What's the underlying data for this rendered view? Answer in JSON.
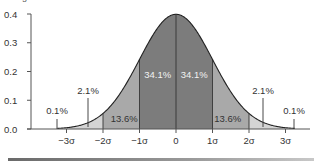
{
  "caption_fragment": "...ming Research",
  "chart_data": {
    "type": "area",
    "xlabel": "",
    "ylabel": "",
    "ylim": [
      0.0,
      0.4
    ],
    "xlim": [
      -3.5,
      3.5
    ],
    "y_ticks": [
      "0.0",
      "0.1",
      "0.2",
      "0.3",
      "0.4"
    ],
    "y_tick_values": [
      0.0,
      0.1,
      0.2,
      0.3,
      0.4
    ],
    "x_ticks": [
      "−3σ",
      "−2σ",
      "−1σ",
      "0",
      "1σ",
      "2σ",
      "3σ"
    ],
    "x_tick_values": [
      -3,
      -2,
      -1,
      0,
      1,
      2,
      3
    ],
    "grid": false,
    "curve": "normal pdf, mean 0, sd 1 (peak ≈ 0.399)",
    "regions": [
      {
        "from": -3,
        "to": -2,
        "percent": "2.1%",
        "color": "#d4d4d4"
      },
      {
        "from": -2,
        "to": -1,
        "percent": "13.6%",
        "color": "#a9a9a9"
      },
      {
        "from": -1,
        "to": 0,
        "percent": "34.1%",
        "color": "#7c7c7c"
      },
      {
        "from": 0,
        "to": 1,
        "percent": "34.1%",
        "color": "#7c7c7c"
      },
      {
        "from": 1,
        "to": 2,
        "percent": "13.6%",
        "color": "#a9a9a9"
      },
      {
        "from": 2,
        "to": 3,
        "percent": "2.1%",
        "color": "#d4d4d4"
      }
    ],
    "tail_labels": [
      {
        "side": "left",
        "percent": "0.1%"
      },
      {
        "side": "right",
        "percent": "0.1%"
      }
    ]
  }
}
